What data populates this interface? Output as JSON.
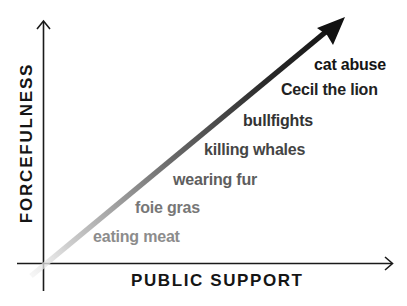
{
  "diagram": {
    "x_axis_label": "PUBLIC SUPPORT",
    "y_axis_label": "FORCEFULNESS",
    "trend_arrow": {
      "description": "gradient arrow from origin to upper right",
      "start_color": "#e6e6e6",
      "end_color": "#111111"
    },
    "items": [
      {
        "label": "eating meat",
        "color": "#8c8c8c",
        "rank": 1
      },
      {
        "label": "foie gras",
        "color": "#777777",
        "rank": 2
      },
      {
        "label": "wearing fur",
        "color": "#5e5e5e",
        "rank": 3
      },
      {
        "label": "killing whales",
        "color": "#454545",
        "rank": 4
      },
      {
        "label": "bullfights",
        "color": "#333333",
        "rank": 5
      },
      {
        "label": "Cecil the lion",
        "color": "#222222",
        "rank": 6
      },
      {
        "label": "cat abuse",
        "color": "#151515",
        "rank": 7
      }
    ],
    "colors": {
      "axis": "#1a1a1a",
      "background": "#ffffff"
    }
  }
}
